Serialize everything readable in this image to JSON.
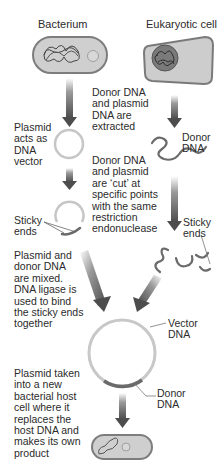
{
  "title_left": "Bacterium",
  "title_right": "Eukaryotic cell",
  "steps": {
    "extract": "Donor DNA\nand plasmid\nDNA are\nextracted",
    "plasmid_vector": "Plasmid\nacts as\nDNA\nvector",
    "donor_dna_1": "Donor\nDNA",
    "cut": "Donor DNA\nand plasmid\nare ‘cut’ at\nspecific points\nwith the same\nrestriction\nendonuclease",
    "sticky_left": "Sticky\nends",
    "sticky_right": "Sticky\nends",
    "mixed": "Plasmid and\ndonor DNA\nare mixed.\nDNA ligase is\nused to bind\nthe sticky ends\ntogether",
    "vector_dna": "Vector\nDNA",
    "donor_dna_2": "Donor\nDNA",
    "host": "Plasmid taken\ninto a new\nbacterial host\ncell where it\nreplaces the\nhost DNA and\nmakes its own\nproduct"
  },
  "colors": {
    "cell_fill": "#c9c9c9",
    "cell_outline": "#7a7a7a",
    "arrow": "#5a5a5a",
    "plasmid": "#c8c8c8",
    "donor_segment": "#6a6a6a"
  }
}
